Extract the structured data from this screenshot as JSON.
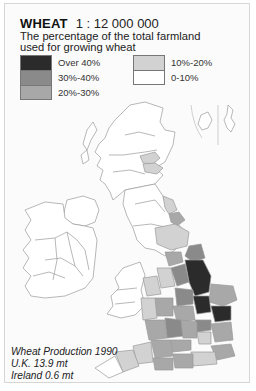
{
  "header": {
    "title": "WHEAT",
    "scale": "1 : 12 000 000",
    "subtitle": "The percentage of the total farmland used for growing wheat"
  },
  "legend": {
    "items": [
      {
        "label": "Over 40%",
        "color": "#2b2b2b"
      },
      {
        "label": "30%-40%",
        "color": "#8a8a8a"
      },
      {
        "label": "20%-30%",
        "color": "#a8a8a8"
      },
      {
        "label": "10%-20%",
        "color": "#d2d2d2"
      },
      {
        "label": "0-10%",
        "color": "#ffffff"
      }
    ]
  },
  "map": {
    "regions": [
      "Scotland",
      "England",
      "Wales",
      "Northern Ireland",
      "Ireland",
      "Orkney",
      "Shetland"
    ]
  },
  "caption": {
    "line1": "Wheat Production 1990",
    "line2": "U.K. 13.9 mt",
    "line3": "Ireland 0.6 mt"
  }
}
